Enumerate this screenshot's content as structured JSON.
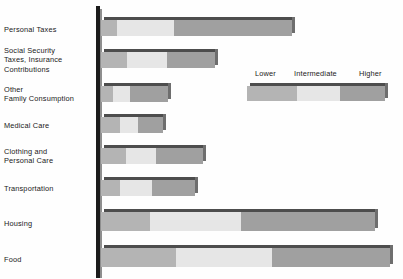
{
  "chart_data": {
    "type": "bar",
    "orientation": "horizontal",
    "stacked": true,
    "title": "",
    "xlabel": "",
    "ylabel": "",
    "grid": false,
    "legend_position": "upper-right",
    "categories": [
      "Personal Taxes",
      "Social Security\nTaxes, Insurance\nContributions",
      "Other\nFamily Consumption",
      "Medical Care",
      "Clothing and\nPersonal Care",
      "Transportation",
      "Housing",
      "Food"
    ],
    "series": [
      {
        "name": "Lower",
        "color": "#b4b4b4",
        "values": [
          16,
          26,
          12,
          19,
          25,
          19,
          49,
          75
        ]
      },
      {
        "name": "Intermediate",
        "color": "#e6e6e6",
        "values": [
          57,
          40,
          17,
          18,
          30,
          32,
          91,
          96
        ]
      },
      {
        "name": "Higher",
        "color": "#a0a0a0",
        "values": [
          118,
          48,
          38,
          25,
          47,
          43,
          134,
          118
        ]
      }
    ],
    "totals": [
      191,
      114,
      67,
      62,
      102,
      94,
      274,
      289
    ],
    "legend_entries": [
      "Lower",
      "Intermediate",
      "Higher"
    ],
    "xlim": [
      0,
      300
    ]
  },
  "legend": {
    "lower": "Lower",
    "intermediate": "Intermediate",
    "higher": "Higher"
  },
  "rows": [
    {
      "label": "Personal Taxes",
      "top": 20,
      "height": 16,
      "lower": 16,
      "intermediate": 57,
      "higher": 118,
      "label_top": 25
    },
    {
      "label": "Social Security\nTaxes, Insurance\nContributions",
      "top": 52,
      "height": 16,
      "lower": 26,
      "intermediate": 40,
      "higher": 48,
      "label_top": 46
    },
    {
      "label": "Other\nFamily Consumption",
      "top": 86,
      "height": 16,
      "lower": 12,
      "intermediate": 17,
      "higher": 38,
      "label_top": 85
    },
    {
      "label": "Medical Care",
      "top": 117,
      "height": 16,
      "lower": 19,
      "intermediate": 18,
      "higher": 25,
      "label_top": 121
    },
    {
      "label": "Clothing and\nPersonal Care",
      "top": 148,
      "height": 16,
      "lower": 25,
      "intermediate": 30,
      "higher": 47,
      "label_top": 147
    },
    {
      "label": "Transportation",
      "top": 180,
      "height": 16,
      "lower": 19,
      "intermediate": 32,
      "higher": 43,
      "label_top": 184
    },
    {
      "label": "Housing",
      "top": 212,
      "height": 19,
      "lower": 49,
      "intermediate": 91,
      "higher": 134,
      "label_top": 219
    },
    {
      "label": "Food",
      "top": 248,
      "height": 19,
      "lower": 75,
      "intermediate": 96,
      "higher": 118,
      "label_top": 255
    }
  ]
}
